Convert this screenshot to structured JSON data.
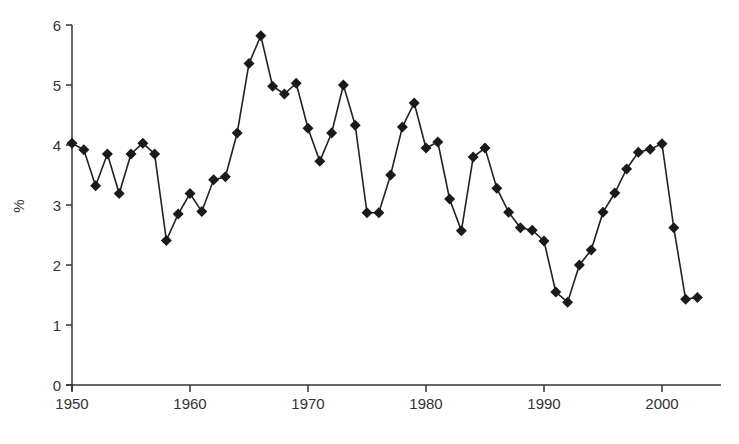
{
  "chart_data": {
    "type": "line",
    "title": "",
    "xlabel": "",
    "ylabel": "%",
    "xlim": [
      1950,
      2005
    ],
    "ylim": [
      0,
      6
    ],
    "grid": false,
    "legend": null,
    "marker": "diamond",
    "line_color": "#222222",
    "x_ticks": [
      1950,
      1960,
      1970,
      1980,
      1990,
      2000
    ],
    "y_ticks": [
      0,
      1,
      2,
      3,
      4,
      5,
      6
    ],
    "x": [
      1950,
      1951,
      1952,
      1953,
      1954,
      1955,
      1956,
      1957,
      1958,
      1959,
      1960,
      1961,
      1962,
      1963,
      1964,
      1965,
      1966,
      1967,
      1968,
      1969,
      1970,
      1971,
      1972,
      1973,
      1974,
      1975,
      1976,
      1977,
      1978,
      1979,
      1980,
      1981,
      1982,
      1983,
      1984,
      1985,
      1986,
      1987,
      1988,
      1989,
      1990,
      1991,
      1992,
      1993,
      1994,
      1995,
      1996,
      1997,
      1998,
      1999,
      2000,
      2001,
      2002,
      2003
    ],
    "values": [
      4.03,
      3.92,
      3.32,
      3.85,
      3.19,
      3.85,
      4.03,
      3.85,
      2.41,
      2.85,
      3.19,
      2.89,
      3.42,
      3.47,
      4.2,
      5.36,
      5.82,
      4.98,
      4.85,
      5.03,
      4.28,
      3.73,
      4.2,
      5.0,
      4.33,
      2.87,
      2.87,
      3.5,
      4.3,
      4.7,
      3.95,
      4.05,
      3.1,
      2.57,
      3.8,
      3.95,
      3.28,
      2.88,
      2.62,
      2.58,
      2.4,
      1.55,
      1.38,
      2.0,
      2.25,
      2.88,
      3.2,
      3.6,
      3.88,
      3.93,
      4.02,
      2.62,
      1.43,
      1.46
    ]
  }
}
